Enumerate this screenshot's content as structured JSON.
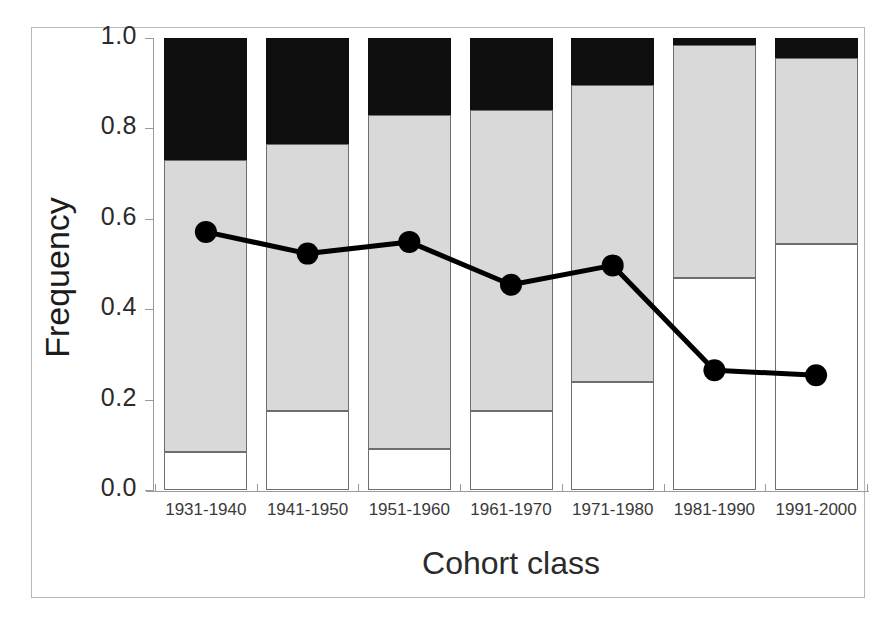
{
  "chart_data": {
    "type": "bar",
    "title": "",
    "xlabel": "Cohort class",
    "ylabel": "Frequency",
    "ylim": [
      0.0,
      1.0
    ],
    "xlim_categories": 7,
    "grid": false,
    "legend": "none",
    "stacked": true,
    "categories": [
      "1931-1940",
      "1941-1950",
      "1951-1960",
      "1961-1970",
      "1971-1980",
      "1981-1990",
      "1991-2000"
    ],
    "ytick_labels": [
      "1.0",
      "0.8",
      "0.6",
      "0.4",
      "0.2",
      "0.0"
    ],
    "ytick_values": [
      1.0,
      0.8,
      0.6,
      0.4,
      0.2,
      0.0
    ],
    "series": [
      {
        "name": "white-segment",
        "color": "#ffffff",
        "values": [
          0.085,
          0.175,
          0.09,
          0.175,
          0.24,
          0.47,
          0.545
        ]
      },
      {
        "name": "gray-segment",
        "color": "#d9d9d9",
        "values": [
          0.645,
          0.59,
          0.74,
          0.665,
          0.655,
          0.515,
          0.41
        ]
      },
      {
        "name": "black-segment",
        "color": "#100f10",
        "values": [
          0.27,
          0.235,
          0.17,
          0.16,
          0.105,
          0.015,
          0.045
        ]
      }
    ],
    "cumulative_tops": {
      "white_top": [
        0.085,
        0.175,
        0.09,
        0.175,
        0.24,
        0.47,
        0.545
      ],
      "gray_top": [
        0.73,
        0.765,
        0.83,
        0.84,
        0.895,
        0.985,
        0.955
      ],
      "black_top": [
        1.0,
        1.0,
        1.0,
        1.0,
        1.0,
        1.0,
        1.0
      ]
    },
    "line_series": {
      "name": "frequency-line",
      "color": "#000000",
      "marker": "filled-circle",
      "values": [
        0.571,
        0.523,
        0.549,
        0.454,
        0.497,
        0.265,
        0.254
      ]
    }
  },
  "axes": {
    "y_title": "Frequency",
    "x_title": "Cohort class"
  }
}
